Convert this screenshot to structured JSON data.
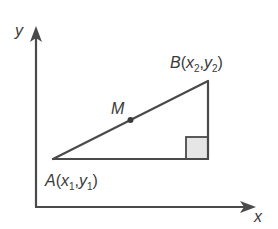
{
  "diagram": {
    "type": "coordinate-geometry",
    "colors": {
      "line": "#4a4a4a",
      "right_angle_fill": "#e6e6e6",
      "text": "#3a3a3a"
    },
    "axes": {
      "x_label": "x",
      "y_label": "y"
    },
    "points": {
      "A": {
        "name": "A",
        "x_sub": "1",
        "y_sub": "1",
        "var_x": "x",
        "var_y": "y"
      },
      "B": {
        "name": "B",
        "x_sub": "2",
        "y_sub": "2",
        "var_x": "x",
        "var_y": "y"
      },
      "M": {
        "name": "M"
      }
    },
    "right_angle_marker": true
  }
}
